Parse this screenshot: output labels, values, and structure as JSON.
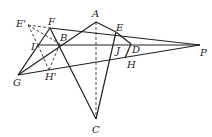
{
  "figure": {
    "type": "geometry-diagram",
    "points": [
      {
        "name": "A",
        "x": 96,
        "y": 22,
        "lx": 92,
        "ly": 17
      },
      {
        "name": "B",
        "x": 60,
        "y": 44,
        "lx": 60,
        "ly": 41
      },
      {
        "name": "C",
        "x": 96,
        "y": 119,
        "lx": 92,
        "ly": 133
      },
      {
        "name": "D",
        "x": 131,
        "y": 44,
        "lx": 132,
        "ly": 53
      },
      {
        "name": "E",
        "x": 116,
        "y": 32,
        "lx": 116,
        "ly": 31
      },
      {
        "name": "E'",
        "x": 28,
        "y": 25,
        "lx": 16,
        "ly": 27
      },
      {
        "name": "F",
        "x": 50,
        "y": 28,
        "lx": 48,
        "ly": 25
      },
      {
        "name": "G",
        "x": 18,
        "y": 75,
        "lx": 13,
        "ly": 86
      },
      {
        "name": "H",
        "x": 125,
        "y": 58,
        "lx": 127,
        "ly": 68
      },
      {
        "name": "H'",
        "x": 49,
        "y": 70,
        "lx": 45,
        "ly": 80
      },
      {
        "name": "I",
        "x": 38,
        "y": 45,
        "lx": 31,
        "ly": 50
      },
      {
        "name": "J",
        "x": 124,
        "y": 45,
        "lx": 116,
        "ly": 54
      },
      {
        "name": "P",
        "x": 200,
        "y": 45,
        "lx": 200,
        "ly": 56
      }
    ],
    "solid_segments": [
      [
        "F",
        "P"
      ],
      [
        "I",
        "P"
      ],
      [
        "G",
        "P"
      ],
      [
        "G",
        "A"
      ],
      [
        "F",
        "C"
      ],
      [
        "A",
        "E"
      ],
      [
        "E",
        "C"
      ],
      [
        "E",
        "D"
      ],
      [
        "D",
        "H"
      ],
      [
        "G",
        "F"
      ]
    ],
    "dashed_segments": [
      [
        "A",
        "C"
      ],
      [
        "E'",
        "F"
      ],
      [
        "E'",
        "B"
      ],
      [
        "E'",
        "I"
      ],
      [
        "I",
        "H'"
      ],
      [
        "B",
        "H'"
      ],
      [
        "I",
        "G"
      ]
    ]
  }
}
